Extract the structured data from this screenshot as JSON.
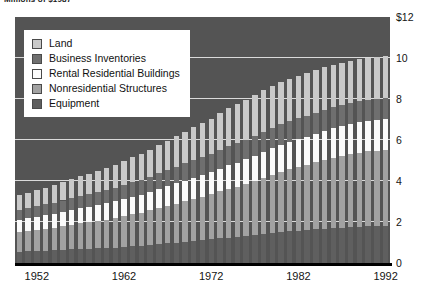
{
  "chart": {
    "title": "Millions of $1987",
    "background": "#545454",
    "gridline_color": "#f2f2f2",
    "axis_color": "#000000"
  },
  "legend": {
    "items": [
      {
        "label": "Land",
        "color": "#c9c9c9",
        "key": "land"
      },
      {
        "label": "Business Inventories",
        "color": "#6f6f6f",
        "key": "business_inventories"
      },
      {
        "label": "Rental Residential Buildings",
        "color": "#fbfbfb",
        "key": "rental_residential"
      },
      {
        "label": "Nonresidential Structures",
        "color": "#a2a2a2",
        "key": "nonresidential_structures"
      },
      {
        "label": "Equipment",
        "color": "#5f5f5f",
        "key": "equipment"
      }
    ]
  },
  "chart_data": {
    "type": "bar",
    "stacked": true,
    "title": "Millions of $1987",
    "xlabel": "",
    "ylabel": "",
    "ylim": [
      0,
      12
    ],
    "yticks": [
      0,
      2,
      4,
      6,
      8,
      10,
      12
    ],
    "ytick_labels": [
      "0",
      "2",
      "4",
      "6",
      "8",
      "10",
      "$12"
    ],
    "grid": true,
    "legend_position": "upper-left",
    "xticks": [
      1952,
      1962,
      1972,
      1982,
      1992
    ],
    "xtick_labels": [
      "1952",
      "1962",
      "1972",
      "1982",
      "1992"
    ],
    "categories": [
      1950,
      1951,
      1952,
      1953,
      1954,
      1955,
      1956,
      1957,
      1958,
      1959,
      1960,
      1961,
      1962,
      1963,
      1964,
      1965,
      1966,
      1967,
      1968,
      1969,
      1970,
      1971,
      1972,
      1973,
      1974,
      1975,
      1976,
      1977,
      1978,
      1979,
      1980,
      1981,
      1982,
      1983,
      1984,
      1985,
      1986,
      1987,
      1988,
      1989,
      1990,
      1991,
      1992
    ],
    "series": [
      {
        "name": "Equipment",
        "color": "#5f5f5f",
        "values": [
          0.55,
          0.57,
          0.59,
          0.61,
          0.62,
          0.64,
          0.66,
          0.68,
          0.69,
          0.71,
          0.73,
          0.75,
          0.78,
          0.81,
          0.84,
          0.88,
          0.92,
          0.96,
          1.0,
          1.04,
          1.08,
          1.11,
          1.15,
          1.2,
          1.24,
          1.27,
          1.31,
          1.36,
          1.41,
          1.46,
          1.5,
          1.54,
          1.57,
          1.6,
          1.64,
          1.67,
          1.7,
          1.72,
          1.75,
          1.77,
          1.79,
          1.8,
          1.82
        ]
      },
      {
        "name": "Nonresidential Structures",
        "color": "#a2a2a2",
        "values": [
          0.95,
          0.99,
          1.03,
          1.07,
          1.11,
          1.15,
          1.2,
          1.25,
          1.29,
          1.34,
          1.39,
          1.44,
          1.5,
          1.56,
          1.62,
          1.69,
          1.76,
          1.83,
          1.9,
          1.98,
          2.05,
          2.12,
          2.2,
          2.29,
          2.38,
          2.46,
          2.55,
          2.65,
          2.75,
          2.85,
          2.95,
          3.04,
          3.12,
          3.2,
          3.28,
          3.36,
          3.44,
          3.51,
          3.57,
          3.62,
          3.66,
          3.68,
          3.7
        ]
      },
      {
        "name": "Rental Residential Buildings",
        "color": "#fbfbfb",
        "values": [
          0.6,
          0.62,
          0.64,
          0.66,
          0.68,
          0.7,
          0.72,
          0.74,
          0.76,
          0.78,
          0.8,
          0.82,
          0.84,
          0.86,
          0.88,
          0.9,
          0.93,
          0.95,
          0.98,
          1.0,
          1.03,
          1.05,
          1.08,
          1.11,
          1.14,
          1.16,
          1.19,
          1.22,
          1.25,
          1.28,
          1.31,
          1.33,
          1.35,
          1.37,
          1.39,
          1.41,
          1.43,
          1.45,
          1.46,
          1.47,
          1.48,
          1.49,
          1.5
        ]
      },
      {
        "name": "Business Inventories",
        "color": "#6f6f6f",
        "values": [
          0.48,
          0.5,
          0.51,
          0.53,
          0.54,
          0.56,
          0.58,
          0.6,
          0.61,
          0.63,
          0.65,
          0.67,
          0.69,
          0.71,
          0.73,
          0.75,
          0.78,
          0.8,
          0.82,
          0.84,
          0.86,
          0.88,
          0.9,
          0.92,
          0.94,
          0.95,
          0.97,
          0.98,
          0.99,
          1.0,
          1.0,
          1.01,
          1.01,
          1.01,
          1.02,
          1.02,
          1.02,
          1.02,
          1.02,
          1.02,
          1.02,
          1.02,
          1.02
        ]
      },
      {
        "name": "Land",
        "color": "#c9c9c9",
        "values": [
          0.72,
          0.75,
          0.78,
          0.81,
          0.84,
          0.88,
          0.92,
          0.96,
          1.0,
          1.04,
          1.08,
          1.12,
          1.16,
          1.21,
          1.26,
          1.31,
          1.37,
          1.42,
          1.48,
          1.54,
          1.6,
          1.66,
          1.72,
          1.79,
          1.85,
          1.9,
          1.95,
          2.0,
          2.03,
          2.05,
          2.06,
          2.07,
          2.08,
          2.08,
          2.08,
          2.08,
          2.08,
          2.07,
          2.07,
          2.07,
          2.06,
          2.06,
          2.06
        ]
      }
    ],
    "totals": [
      3.3,
      3.43,
      3.55,
      3.68,
      3.79,
      3.93,
      4.08,
      4.23,
      4.35,
      4.5,
      4.65,
      4.8,
      4.97,
      5.15,
      5.33,
      5.53,
      5.76,
      5.96,
      6.18,
      6.4,
      6.62,
      6.82,
      7.05,
      7.31,
      7.55,
      7.74,
      7.97,
      8.21,
      8.43,
      8.64,
      8.82,
      8.99,
      9.13,
      9.26,
      9.41,
      9.54,
      9.67,
      9.77,
      9.87,
      9.95,
      10.01,
      10.05,
      10.1
    ]
  }
}
